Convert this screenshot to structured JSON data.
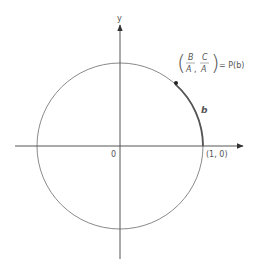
{
  "diagram": {
    "type": "unit-circle",
    "axes": {
      "y_label": "y",
      "origin_label": "0",
      "point_on_x_axis_label": "(1, 0)"
    },
    "point": {
      "name": "P(b)",
      "coords_label": {
        "x_numerator": "B",
        "x_denominator": "A",
        "separator": ",",
        "y_numerator": "C",
        "y_denominator": "A",
        "equals": "= P(b)"
      }
    },
    "arc_label": "b",
    "colors": {
      "circle": "#7a7a7a",
      "axis": "#555555",
      "arc_highlight": "#555555",
      "point": "#222222",
      "text": "#555555"
    }
  }
}
